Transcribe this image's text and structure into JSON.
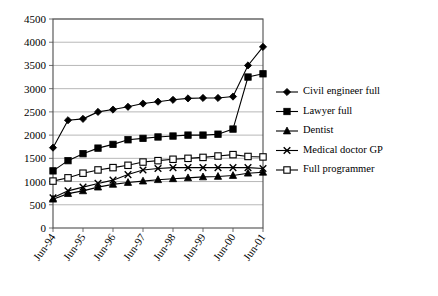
{
  "chart_data": {
    "type": "line",
    "title": "",
    "xlabel": "",
    "ylabel": "",
    "ylim": [
      0,
      4500
    ],
    "ytick_step": 500,
    "grid": true,
    "legend_position": "right",
    "yticks": [
      "0",
      "500",
      "1000",
      "1500",
      "2000",
      "2500",
      "3000",
      "3500",
      "4000",
      "4500"
    ],
    "categories": [
      "Jun-94",
      "Dec-94",
      "Jun-95",
      "Dec-95",
      "Jun-96",
      "Dec-96",
      "Jun-97",
      "Dec-97",
      "Jun-98",
      "Dec-98",
      "Jun-99",
      "Dec-99",
      "Jun-00",
      "Dec-00",
      "Jun-01"
    ],
    "xtick_labels": [
      "Jun-94",
      "Jun-95",
      "Jun-96",
      "Jun-97",
      "Jun-98",
      "Jun-99",
      "Jun-00",
      "Jun-01"
    ],
    "series": [
      {
        "name": "Civil engineer full",
        "marker": "diamond-filled",
        "values": [
          1730,
          2320,
          2350,
          2500,
          2550,
          2610,
          2680,
          2720,
          2760,
          2790,
          2800,
          2800,
          2830,
          3500,
          3900
        ]
      },
      {
        "name": "Lawyer full",
        "marker": "square-filled",
        "values": [
          1230,
          1450,
          1600,
          1720,
          1800,
          1900,
          1930,
          1960,
          1980,
          2000,
          2000,
          2020,
          2130,
          3250,
          3320
        ]
      },
      {
        "name": "Dentist",
        "marker": "triangle-filled",
        "values": [
          620,
          740,
          800,
          880,
          940,
          980,
          1010,
          1040,
          1060,
          1080,
          1100,
          1110,
          1130,
          1180,
          1200
        ]
      },
      {
        "name": "Medical doctor GP",
        "marker": "cross",
        "values": [
          650,
          800,
          880,
          960,
          1030,
          1150,
          1250,
          1280,
          1300,
          1300,
          1300,
          1300,
          1300,
          1300,
          1280
        ]
      },
      {
        "name": "Full programmer",
        "marker": "square-open",
        "values": [
          1010,
          1080,
          1180,
          1250,
          1300,
          1350,
          1420,
          1450,
          1480,
          1500,
          1520,
          1550,
          1580,
          1540,
          1530
        ]
      }
    ]
  }
}
